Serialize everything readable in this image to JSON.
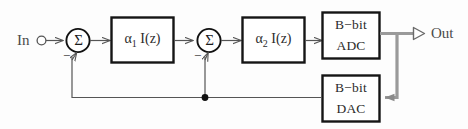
{
  "diagram": {
    "type": "block-diagram",
    "colors": {
      "line": "#555555",
      "block_border": "#1a1a1a",
      "digital_bus": "#8a8a8a",
      "background": "#fdfdfd",
      "text": "#2b2b2b"
    },
    "terminals": {
      "input": {
        "label": "In",
        "glyph": "open-circle"
      },
      "output": {
        "label": "Out",
        "glyph": "open-arrow-terminal"
      }
    },
    "summing_nodes": [
      {
        "id": "sum1",
        "symbol": "Σ",
        "sign_positive": "",
        "sign_negative": "−"
      },
      {
        "id": "sum2",
        "symbol": "Σ",
        "sign_positive": "",
        "sign_negative": "−"
      }
    ],
    "blocks": [
      {
        "id": "integrator1",
        "coef": "α",
        "sub": "1",
        "expr": "I(z)",
        "full_label": "α₁ I(z)"
      },
      {
        "id": "integrator2",
        "coef": "α",
        "sub": "2",
        "expr": "I(z)",
        "full_label": "α₂ I(z)"
      },
      {
        "id": "adc",
        "line1": "B−bit",
        "line2": "ADC",
        "full_label": "B−bit ADC"
      },
      {
        "id": "dac",
        "line1": "B−bit",
        "line2": "DAC",
        "full_label": "B−bit DAC"
      }
    ],
    "connections": [
      {
        "from": "In",
        "to": "sum1",
        "style": "thin"
      },
      {
        "from": "sum1",
        "to": "integrator1",
        "style": "thin"
      },
      {
        "from": "integrator1",
        "to": "sum2",
        "style": "thin"
      },
      {
        "from": "sum2",
        "to": "integrator2",
        "style": "thin"
      },
      {
        "from": "integrator2",
        "to": "adc",
        "style": "thin"
      },
      {
        "from": "adc",
        "to": "Out",
        "style": "bus"
      },
      {
        "from": "adc",
        "to": "dac",
        "style": "bus"
      },
      {
        "from": "dac",
        "to": "sum1",
        "style": "thin-feedback"
      },
      {
        "from": "dac",
        "to": "sum2",
        "style": "thin-feedback"
      }
    ],
    "junction_dot": {
      "x": 205,
      "y": 97
    }
  }
}
